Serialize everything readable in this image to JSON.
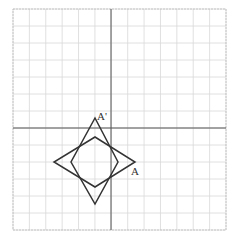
{
  "diagram": {
    "type": "coordinate-grid-rotation",
    "grid": {
      "cols": 13,
      "rows": 13,
      "left": 13,
      "top": 9,
      "right": 226,
      "bottom": 230,
      "origin_px": [
        111,
        128
      ],
      "grid_color": "#d8d8d8",
      "axis_color": "#555555",
      "border_color": "#bbbbbb"
    },
    "shapes": [
      {
        "name": "original-quadrilateral",
        "points_px": [
          [
            95,
            137
          ],
          [
            135,
            162
          ],
          [
            95,
            187
          ],
          [
            54,
            162
          ]
        ],
        "stroke": "#333333"
      },
      {
        "name": "rotated-quadrilateral",
        "points_px": [
          [
            95,
            118
          ],
          [
            118,
            162
          ],
          [
            95,
            204
          ],
          [
            71,
            162
          ]
        ],
        "stroke": "#333333"
      }
    ],
    "labels": [
      {
        "text": "A'",
        "x": 97,
        "y": 120
      },
      {
        "text": "A",
        "x": 131,
        "y": 175
      }
    ]
  }
}
